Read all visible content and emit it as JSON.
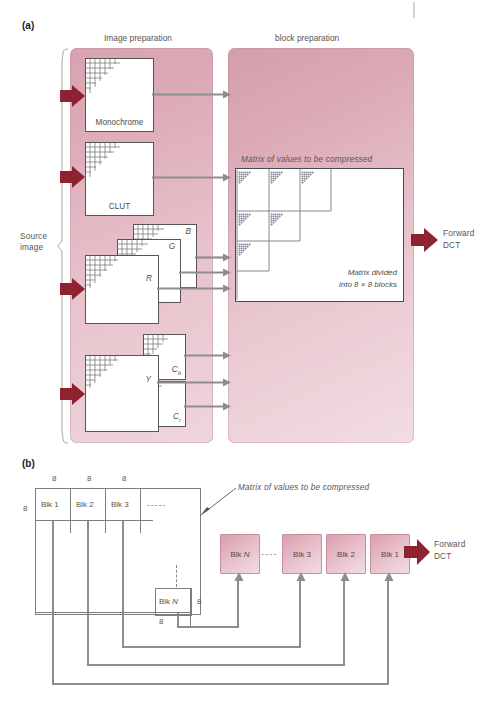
{
  "figure": {
    "part_a": {
      "tag": "(a)",
      "stage_titles": {
        "image_preparation": "Image preparation",
        "block_preparation": "block preparation"
      },
      "source_label_line1": "Source",
      "source_label_line2": "image",
      "output_label_line1": "Forward",
      "output_label_line2": "DCT",
      "image_boxes": [
        {
          "id": "monochrome",
          "label": "Monochrome",
          "style": "bottom-center"
        },
        {
          "id": "clut",
          "label": "CLUT",
          "style": "bottom-center"
        },
        {
          "id": "b",
          "label": "B",
          "style": "top-right-italic"
        },
        {
          "id": "g",
          "label": "G",
          "style": "top-right-italic"
        },
        {
          "id": "r",
          "label": "R",
          "style": "top-right-italic"
        },
        {
          "id": "cb",
          "label": "Cb",
          "style": "bottom-right-italic-sub"
        },
        {
          "id": "cr",
          "label": "Cr",
          "style": "bottom-right-italic-sub"
        },
        {
          "id": "y",
          "label": "Y",
          "style": "top-right-italic"
        }
      ],
      "matrix": {
        "title": "Matrix of values to be compressed",
        "caption_line1": "Matrix divided",
        "caption_line2": "into 8 × 8 blocks"
      },
      "arrow_count_source": 4,
      "arrow_count_to_blockprep": 8
    },
    "part_b": {
      "tag": "(b)",
      "dim_labels": {
        "top": [
          "8",
          "8",
          "8"
        ],
        "left": "8",
        "blkn_right": "8",
        "blkn_below": "8"
      },
      "matrix_blocks": [
        {
          "label": "Blk 1"
        },
        {
          "label": "Blk 2"
        },
        {
          "label": "Blk 3"
        },
        {
          "label": "- - - - -"
        }
      ],
      "last_block_label": "Blk N",
      "annotation": "Matrix of values to be compressed",
      "serial_blocks": [
        {
          "label": "Blk N",
          "italic_tail": "N"
        },
        {
          "label": "Blk 3"
        },
        {
          "label": "Blk 2"
        },
        {
          "label": "Blk 1"
        }
      ],
      "serial_dash": "- - - -",
      "output_label_line1": "Forward",
      "output_label_line2": "DCT"
    },
    "colors": {
      "panel_pink_dark": "#d49eac",
      "panel_pink_light": "#f2dde2",
      "arrow_red": "#8e2230",
      "arrow_gray": "#8d8d8d",
      "line_gray": "#7d7d7d",
      "text_gray": "#555555"
    }
  }
}
